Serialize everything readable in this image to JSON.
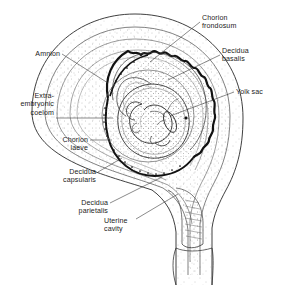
{
  "figure": {
    "type": "anatomical-diagram",
    "background_color": "#ffffff",
    "line_color": "#1c1c1c",
    "stipple_color": "#8a8a8a",
    "width": 281,
    "height": 287
  },
  "labels": [
    {
      "id": "chorion-frondosum",
      "text": "Chorion\nfrondosum",
      "align": "left",
      "x": 202,
      "y": 14,
      "leader": [
        [
          200,
          22
        ],
        [
          150,
          62
        ]
      ]
    },
    {
      "id": "decidua-basalis",
      "text": "Decidua\nbasalis",
      "align": "left",
      "x": 222,
      "y": 47,
      "leader": [
        [
          220,
          55
        ],
        [
          168,
          80
        ]
      ]
    },
    {
      "id": "yolk-sac",
      "text": "Yolk sac",
      "align": "left",
      "x": 236,
      "y": 88,
      "leader": [
        [
          234,
          92
        ],
        [
          170,
          116
        ]
      ]
    },
    {
      "id": "amnion",
      "text": "Amnion",
      "align": "right",
      "x": 28,
      "y": 50,
      "leader": [
        [
          62,
          54
        ],
        [
          108,
          83
        ]
      ]
    },
    {
      "id": "extra-embryonic-coelom",
      "text": "Extra-\nembryonic\ncoelom",
      "align": "right",
      "x": 14,
      "y": 92,
      "leader": [
        [
          56,
          118
        ],
        [
          113,
          118
        ]
      ]
    },
    {
      "id": "chorion-laeve",
      "text": "Chorion\nlaeve",
      "align": "right",
      "x": 24,
      "y": 136,
      "leader": [
        [
          90,
          140
        ],
        [
          108,
          140
        ]
      ]
    },
    {
      "id": "decidua-capsularis",
      "text": "Decidua\ncapsularis",
      "align": "right",
      "x": 34,
      "y": 168,
      "leader": [
        [
          98,
          172
        ],
        [
          119,
          160
        ]
      ]
    },
    {
      "id": "decidua-parietalis",
      "text": "Decidua\nparietalis",
      "align": "right",
      "x": 56,
      "y": 199,
      "leader": [
        [
          110,
          203
        ],
        [
          160,
          178
        ]
      ]
    },
    {
      "id": "uterine-cavity",
      "text": "Uterine\ncavity",
      "align": "left",
      "x": 104,
      "y": 217,
      "leader": [
        [
          136,
          219
        ],
        [
          176,
          196
        ]
      ]
    }
  ],
  "structures": [
    {
      "id": "uterine-wall",
      "name": "Uterine wall (myometrium)"
    },
    {
      "id": "decidua-parietalis",
      "name": "Decidua parietalis"
    },
    {
      "id": "uterine-cavity",
      "name": "Uterine cavity"
    },
    {
      "id": "decidua-capsularis",
      "name": "Decidua capsularis"
    },
    {
      "id": "chorion-laeve",
      "name": "Chorion laeve"
    },
    {
      "id": "chorion-frondosum",
      "name": "Chorion frondosum"
    },
    {
      "id": "decidua-basalis",
      "name": "Decidua basalis"
    },
    {
      "id": "extra-embryonic-coelom",
      "name": "Extra-embryonic coelom"
    },
    {
      "id": "amnion",
      "name": "Amnion"
    },
    {
      "id": "amniotic-cavity",
      "name": "Amniotic cavity"
    },
    {
      "id": "embryo",
      "name": "Embryo"
    },
    {
      "id": "yolk-sac",
      "name": "Yolk sac"
    },
    {
      "id": "cervical-canal",
      "name": "Cervical canal"
    },
    {
      "id": "vagina",
      "name": "Vagina"
    }
  ]
}
